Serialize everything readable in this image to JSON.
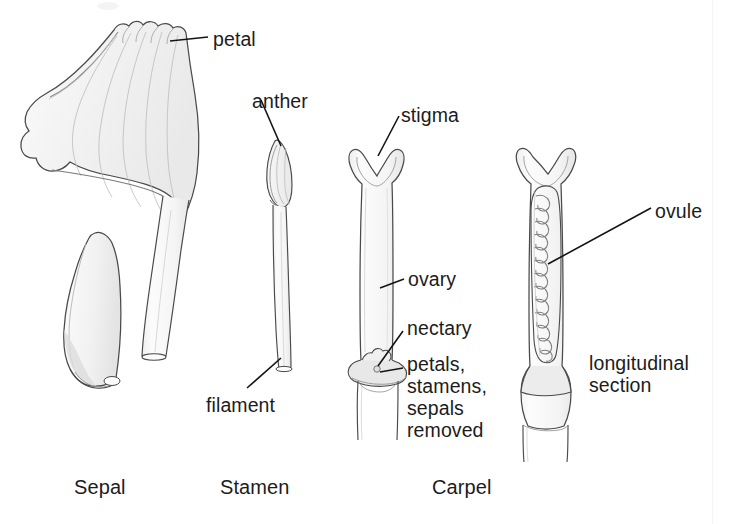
{
  "figure": {
    "background_color": "#ffffff",
    "ink_color": "#1c1c1c",
    "outline_color": "#3a3a3a",
    "fill_color": "#f4f4f4",
    "width": 735,
    "height": 524
  },
  "callout_labels": [
    {
      "key": "petal",
      "text": "petal",
      "x": 213,
      "y": 28,
      "leader": true
    },
    {
      "key": "anther",
      "text": "anther",
      "x": 252,
      "y": 90,
      "leader": true
    },
    {
      "key": "stigma",
      "text": "stigma",
      "x": 401,
      "y": 104,
      "leader": true
    },
    {
      "key": "ovary",
      "text": "ovary",
      "x": 408,
      "y": 268,
      "leader": true
    },
    {
      "key": "nectary",
      "text": "nectary",
      "x": 407,
      "y": 317,
      "leader": true
    },
    {
      "key": "filament",
      "text": "filament",
      "x": 206,
      "y": 394,
      "leader": true
    },
    {
      "key": "ovule",
      "text": "ovule",
      "x": 655,
      "y": 200,
      "leader": true
    }
  ],
  "block_labels": [
    {
      "key": "removed-note",
      "text": "petals,\nstamens,\nsepals\nremoved",
      "x": 407,
      "y": 353,
      "leader": true
    },
    {
      "key": "longitudinal-section",
      "text": "longitudinal\nsection",
      "x": 589,
      "y": 352,
      "leader": false
    }
  ],
  "group_labels": [
    {
      "key": "sepal",
      "text": "Sepal",
      "x": 74,
      "y": 476
    },
    {
      "key": "stamen",
      "text": "Stamen",
      "x": 220,
      "y": 476
    },
    {
      "key": "carpel",
      "text": "Carpel",
      "x": 432,
      "y": 476
    }
  ],
  "specimens": [
    {
      "key": "petal-specimen",
      "name": "petal",
      "group": "Sepal"
    },
    {
      "key": "sepal-specimen",
      "name": "sepal",
      "group": "Sepal"
    },
    {
      "key": "stamen-specimen",
      "name": "stamen",
      "group": "Stamen"
    },
    {
      "key": "carpel-specimen",
      "name": "carpel whole",
      "group": "Carpel"
    },
    {
      "key": "carpel-ls-specimen",
      "name": "carpel longitudinal section",
      "group": "Carpel"
    }
  ],
  "ovule_count": 13
}
